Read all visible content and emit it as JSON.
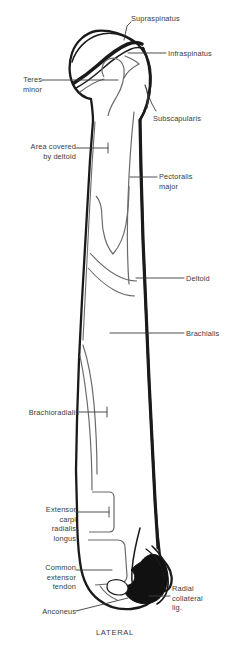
{
  "figure": {
    "caption": "LATERAL",
    "ink_color": "#1a1a1a",
    "fill_color": "#ffffff",
    "detail_line_color": "#5a5a5a",
    "solid_region_color": "#111111",
    "label_color": "#3a3a3a"
  },
  "labels": [
    {
      "id": "supraspinatus",
      "text": "Supraspinatus",
      "side": "left",
      "x": 131,
      "y": 14,
      "w": 95
    },
    {
      "id": "infraspinatus",
      "text": "Infraspinatus",
      "side": "left",
      "x": 168,
      "y": 49,
      "w": 62
    },
    {
      "id": "teres-minor",
      "text": "Teres\nminor",
      "side": "right",
      "x": 2,
      "y": 75,
      "w": 40
    },
    {
      "id": "subscapularis",
      "text": "Subscapularis",
      "side": "left",
      "x": 153,
      "y": 114,
      "w": 70
    },
    {
      "id": "area-deltoid",
      "text": "Area  covered\nby deltoid",
      "side": "right",
      "x": 10,
      "y": 142,
      "w": 66
    },
    {
      "id": "pectoralis-major",
      "text": "Pectoralis\nmajor",
      "side": "left",
      "x": 159,
      "y": 172,
      "w": 60
    },
    {
      "id": "deltoid",
      "text": "Deltoid",
      "side": "left",
      "x": 186,
      "y": 274,
      "w": 44
    },
    {
      "id": "brachialis",
      "text": "Brachialis",
      "side": "left",
      "x": 186,
      "y": 329,
      "w": 44
    },
    {
      "id": "brachioradialis",
      "text": "Brachioradialis",
      "side": "right",
      "x": 7,
      "y": 408,
      "w": 72
    },
    {
      "id": "ecrl",
      "text": "Extensor\ncarpi\nradialis\nlongus",
      "side": "right",
      "x": 18,
      "y": 505,
      "w": 58
    },
    {
      "id": "common-ext",
      "text": "Common\nextensor\ntendon",
      "side": "right",
      "x": 15,
      "y": 563,
      "w": 61
    },
    {
      "id": "anconeus",
      "text": "Anconeus",
      "side": "right",
      "x": 6,
      "y": 607,
      "w": 70
    },
    {
      "id": "radial-coll",
      "text": "Radial\ncollateral\nlig.",
      "side": "left",
      "x": 172,
      "y": 584,
      "w": 56
    }
  ],
  "leader_lines": [
    {
      "id": "supraspinatus-leader",
      "points": "131,22 127,26 124,40"
    },
    {
      "id": "infraspinatus-leader",
      "points": "166,53 128,53"
    },
    {
      "id": "teres-minor-leader",
      "points": "42,80 66,80 118,80"
    },
    {
      "id": "subscapularis-leader",
      "points": "156,111 152,104 147,92"
    },
    {
      "id": "area-deltoid-leader",
      "points": "76,148 108,148"
    },
    {
      "id": "pectoralis-leader",
      "points": "157,177 130,177"
    },
    {
      "id": "deltoid-leader",
      "points": "184,278 136,278"
    },
    {
      "id": "brachialis-leader",
      "points": "184,333 110,333"
    },
    {
      "id": "brachioradialis-leader",
      "points": "79,412 107,412"
    },
    {
      "id": "ecrl-leader",
      "points": "76,512 109,512"
    },
    {
      "id": "common-ext-leader",
      "points": "76,570 112,570"
    },
    {
      "id": "anconeus-leader",
      "points": "76,611 128,598"
    },
    {
      "id": "radial-coll-leader",
      "points": "170,596 149,596"
    }
  ],
  "anatomy_parts": [
    {
      "id": "humeral-head",
      "name": "humeral head"
    },
    {
      "id": "greater-tubercle",
      "name": "greater tubercle"
    },
    {
      "id": "lesser-tubercle",
      "name": "lesser tubercle"
    },
    {
      "id": "bicipital-groove",
      "name": "intertubercular groove"
    },
    {
      "id": "surgical-neck",
      "name": "surgical neck"
    },
    {
      "id": "humeral-shaft",
      "name": "shaft of humerus"
    },
    {
      "id": "deltoid-tuberosity",
      "name": "deltoid tuberosity"
    },
    {
      "id": "lateral-epicondyle",
      "name": "lateral epicondyle"
    },
    {
      "id": "capitellum",
      "name": "capitellum"
    }
  ]
}
